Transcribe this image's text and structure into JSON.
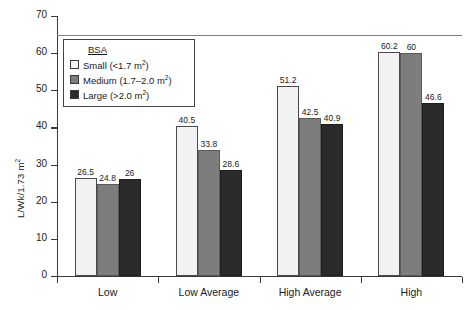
{
  "chart_data": {
    "type": "bar",
    "title": "",
    "xlabel": "",
    "ylabel": "L/Wk/1.73 m²",
    "ylim": [
      0,
      70
    ],
    "ytick_step": 10,
    "grid": false,
    "legend_position": "upper-left-inside",
    "categories": [
      "Low",
      "Low Average",
      "High Average",
      "High"
    ],
    "series": [
      {
        "name": "Small (<1.7 m²)",
        "key": "small",
        "color": "#f2f2f2",
        "values": [
          26.5,
          40.5,
          51.2,
          60.2
        ],
        "labels": [
          "26.5",
          "40.5",
          "51.2",
          "60.2"
        ]
      },
      {
        "name": "Medium (1.7–2.0 m²)",
        "key": "medium",
        "color": "#7d7d7d",
        "values": [
          24.8,
          33.8,
          42.5,
          60.0
        ],
        "labels": [
          "24.8",
          "33.8",
          "42.5",
          "60"
        ]
      },
      {
        "name": "Large (>2.0 m²)",
        "key": "large",
        "color": "#2b2b2b",
        "values": [
          26.0,
          28.6,
          40.9,
          46.6
        ],
        "labels": [
          "26",
          "28.6",
          "40.9",
          "46.6"
        ]
      }
    ],
    "yticks": [
      "0",
      "10",
      "20",
      "30",
      "40",
      "50",
      "60",
      "70"
    ],
    "reference_line": 65,
    "annotations": []
  },
  "legend": {
    "title": "BSA",
    "items": [
      {
        "label_main": "Small (<1.7 m",
        "label_sup": "2",
        "label_tail": ")"
      },
      {
        "label_main": "Medium (1.7–2.0 m",
        "label_sup": "2",
        "label_tail": ")"
      },
      {
        "label_main": "Large (>2.0 m",
        "label_sup": "2",
        "label_tail": ")"
      }
    ]
  },
  "axis": {
    "y_title_main": "L/Wk/1.73 m",
    "y_title_sup": "2"
  }
}
